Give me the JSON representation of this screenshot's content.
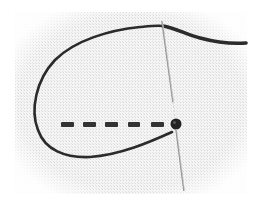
{
  "image": {
    "subject": "Running stitch embroidery demonstration",
    "description": "Dark thread forming a loop on white even-weave fabric, with a needle passing through the fabric beside a row of dashed running stitches ending in a knot.",
    "colors": {
      "background": "#ffffff",
      "fabric": "#f2f2f2",
      "fabric_weave": "#d9d9d9",
      "thread": "#2b2b2b",
      "needle": "#9a9a9a",
      "needle_highlight": "#e8e8e8"
    },
    "elements": {
      "stitch_count": 5,
      "knot": "thread-knot",
      "needle": "embroidery-needle"
    }
  }
}
